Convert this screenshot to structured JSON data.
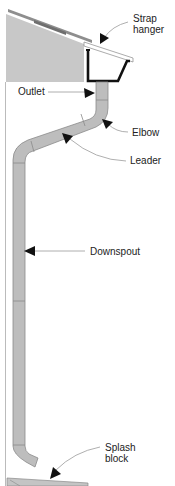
{
  "diagram": {
    "colors": {
      "siding": "#c8c8c8",
      "pipe": "#bdbdbd",
      "pipe_stroke": "#8a8a8a",
      "gutter": "#111111",
      "roof": "#9a9a9a",
      "leader_line": "#9a9a9a",
      "arrow": "#111111",
      "wall": "#bbbbbb"
    },
    "labels": {
      "strap_hanger": "Strap\nhanger",
      "outlet": "Outlet",
      "elbow": "Elbow",
      "leader": "Leader",
      "downspout": "Downspout",
      "splash_block": "Splash\nblock"
    }
  }
}
